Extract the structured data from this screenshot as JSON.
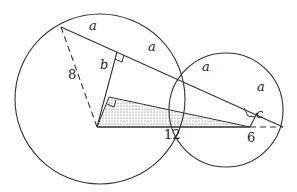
{
  "diagram": {
    "type": "geometry",
    "colors": {
      "stroke": "#333333",
      "fill_dots": "#555555"
    },
    "labels": {
      "a1": "a",
      "a2": "a",
      "a3": "a",
      "a4": "a",
      "b": "b",
      "c": "c",
      "radius": "8",
      "base": "12",
      "extension": "6"
    }
  }
}
